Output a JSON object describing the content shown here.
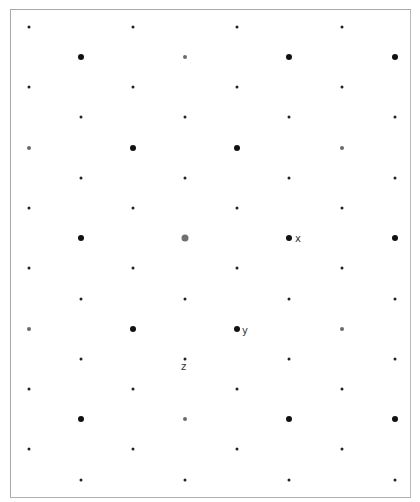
{
  "diagram": {
    "type": "staggered-dot-lattice",
    "frame": {
      "left": 10,
      "top": 9,
      "width": 401,
      "height": 489,
      "border_color": "#a8a8a8"
    },
    "columns": {
      "even_rows": [
        29,
        133,
        237,
        342
      ],
      "odd_rows": [
        81,
        185,
        289,
        395
      ]
    },
    "row_y": [
      27,
      57,
      87,
      117,
      148,
      178,
      208,
      238,
      268,
      299,
      329,
      359,
      389,
      419,
      449,
      480
    ],
    "dot_styles": {
      "small": {
        "size": 3,
        "color": "#222222"
      },
      "medium": {
        "size": 4,
        "color": "#6a6a6a"
      },
      "large": {
        "size": 6,
        "color": "#111111"
      },
      "large-gray": {
        "size": 7,
        "color": "#707070"
      }
    },
    "rows": [
      [
        "small",
        "small",
        "small",
        "small"
      ],
      [
        "large",
        "medium",
        "large",
        "large"
      ],
      [
        "small",
        "small",
        "small",
        "small"
      ],
      [
        "small",
        "small",
        "small",
        "small"
      ],
      [
        "medium",
        "large",
        "large",
        "medium"
      ],
      [
        "small",
        "small",
        "small",
        "small"
      ],
      [
        "small",
        "small",
        "small",
        "small"
      ],
      [
        "large",
        "large-gray",
        "large",
        "large"
      ],
      [
        "small",
        "small",
        "small",
        "small"
      ],
      [
        "small",
        "small",
        "small",
        "small"
      ],
      [
        "medium",
        "large",
        "large",
        "medium"
      ],
      [
        "small",
        "small",
        "small",
        "small"
      ],
      [
        "small",
        "small",
        "small",
        "small"
      ],
      [
        "large",
        "medium",
        "large",
        "large"
      ],
      [
        "small",
        "small",
        "small",
        "small"
      ],
      [
        "small",
        "small",
        "small",
        "small"
      ]
    ],
    "labels": [
      {
        "text": "x",
        "x": 295,
        "y": 234
      },
      {
        "text": "y",
        "x": 242,
        "y": 326
      },
      {
        "text": "z",
        "x": 181,
        "y": 362
      }
    ]
  }
}
